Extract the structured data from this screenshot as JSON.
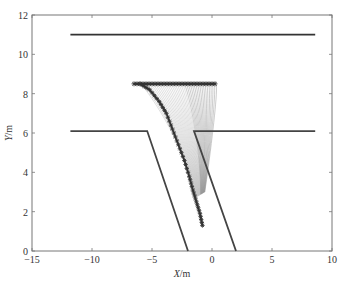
{
  "chart_data": {
    "type": "line",
    "title": "",
    "xlabel": "X/m",
    "ylabel": "Y/m",
    "xlim": [
      -15,
      10
    ],
    "ylim": [
      0,
      12
    ],
    "xticks": [
      -15,
      -10,
      -5,
      0,
      5,
      10
    ],
    "yticks": [
      0,
      2,
      4,
      6,
      8,
      10,
      12
    ],
    "grid": false,
    "legend": null,
    "series": [
      {
        "name": "upper-boundary",
        "style": "solid-thick",
        "color": "#333333",
        "x": [
          -11.8,
          8.6
        ],
        "y": [
          11.0,
          11.0
        ]
      },
      {
        "name": "lower-left-boundary",
        "style": "solid-thick",
        "color": "#444444",
        "x": [
          -11.8,
          -5.4,
          -2.0
        ],
        "y": [
          6.1,
          6.1,
          0.0
        ]
      },
      {
        "name": "lower-right-boundary",
        "style": "solid-thick",
        "color": "#444444",
        "x": [
          8.6,
          -1.5,
          2.0
        ],
        "y": [
          6.1,
          6.1,
          0.0
        ]
      },
      {
        "name": "start-line-markers",
        "style": "star-markers",
        "color": "#444444",
        "x": [
          -6.5,
          0.3
        ],
        "y": [
          8.5,
          8.5
        ]
      },
      {
        "name": "main-trajectory",
        "style": "star-markers",
        "color": "#333333",
        "x": [
          -6.0,
          -5.2,
          -4.4,
          -3.8,
          -3.3,
          -2.8,
          -2.3,
          -1.9,
          -1.6,
          -1.3,
          -1.0,
          -0.8
        ],
        "y": [
          8.5,
          8.2,
          7.6,
          7.0,
          6.2,
          5.4,
          4.6,
          3.8,
          3.1,
          2.5,
          1.9,
          1.3
        ]
      },
      {
        "name": "trajectory-fan",
        "style": "thin-lines-gray",
        "color": "#999999",
        "count": 40,
        "start_x_range": [
          -6.0,
          0.3
        ],
        "start_y": 8.5,
        "peak_y": 9.0,
        "converge_x": -0.6,
        "converge_y": 3.0
      }
    ]
  }
}
